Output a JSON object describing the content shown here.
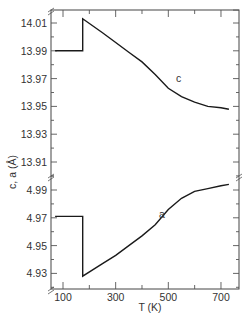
{
  "chart_data": {
    "type": "line",
    "title": "",
    "xlabel": "T (K)",
    "ylabel": "c, a (Å)",
    "xlim": [
      70,
      760
    ],
    "x_ticks": [
      100,
      300,
      500,
      700
    ],
    "y_axis_break": true,
    "y_ticks_upper": [
      "14.01",
      "13.99",
      "13.97",
      "13.95",
      "13.93",
      "13.91"
    ],
    "y_ticks_lower": [
      "4.99",
      "4.97",
      "4.95",
      "4.93"
    ],
    "ylim_upper": [
      13.9,
      14.02
    ],
    "ylim_lower": [
      4.92,
      5.0
    ],
    "grid": false,
    "legend": "none (curves labeled inline)",
    "series": [
      {
        "name": "c",
        "label": "c",
        "x": [
          70,
          120,
          175,
          175,
          250,
          300,
          350,
          400,
          450,
          500,
          550,
          600,
          650,
          700,
          730
        ],
        "values": [
          13.99,
          13.99,
          13.99,
          14.013,
          14.003,
          13.996,
          13.989,
          13.982,
          13.973,
          13.963,
          13.957,
          13.953,
          13.95,
          13.949,
          13.948
        ]
      },
      {
        "name": "a",
        "label": "a",
        "x": [
          70,
          120,
          175,
          175,
          250,
          300,
          350,
          400,
          450,
          500,
          550,
          600,
          650,
          700,
          730
        ],
        "values": [
          4.971,
          4.971,
          4.971,
          4.928,
          4.937,
          4.943,
          4.95,
          4.957,
          4.965,
          4.976,
          4.984,
          4.989,
          4.991,
          4.993,
          4.994
        ]
      }
    ]
  }
}
